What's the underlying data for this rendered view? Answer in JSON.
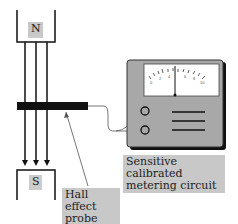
{
  "diagram": {
    "north_pole_label": "N",
    "south_pole_label": "S",
    "probe_label": "Hall effect probe",
    "probe_label_lines": [
      "Hall effect",
      "probe"
    ],
    "meter_label_lines": [
      "Sensitive calibrated",
      "metering circuit"
    ],
    "meter_scale": [
      "0",
      "2",
      "4",
      "6",
      "8",
      "10"
    ],
    "colors": {
      "label_bg": "#c8c8c8",
      "meter_body": "#a8a8a8",
      "line": "#111111"
    }
  }
}
